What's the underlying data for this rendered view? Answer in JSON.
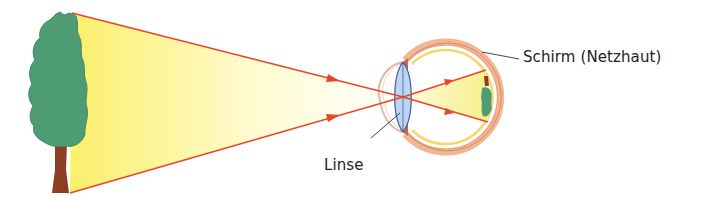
{
  "figure": {
    "title": "",
    "labels": {
      "retina": "Schirm (Netzhaut)",
      "lens": "Linse"
    },
    "colors": {
      "ray": "#e8452a",
      "light_cone_start": "#fbef6a",
      "light_cone_end": "#ffffff",
      "tree_canopy": "#4e9c74",
      "tree_trunk": "#8b3e22",
      "lens_fill": "#bcd6f0",
      "lens_stroke": "#3d5a9c",
      "eye_outer": "#e9a27a",
      "eye_yellow": "#f6d76a",
      "leader_line": "#333333"
    },
    "objects": [
      "tree",
      "light-cone",
      "eye",
      "lens",
      "retina-image"
    ]
  }
}
